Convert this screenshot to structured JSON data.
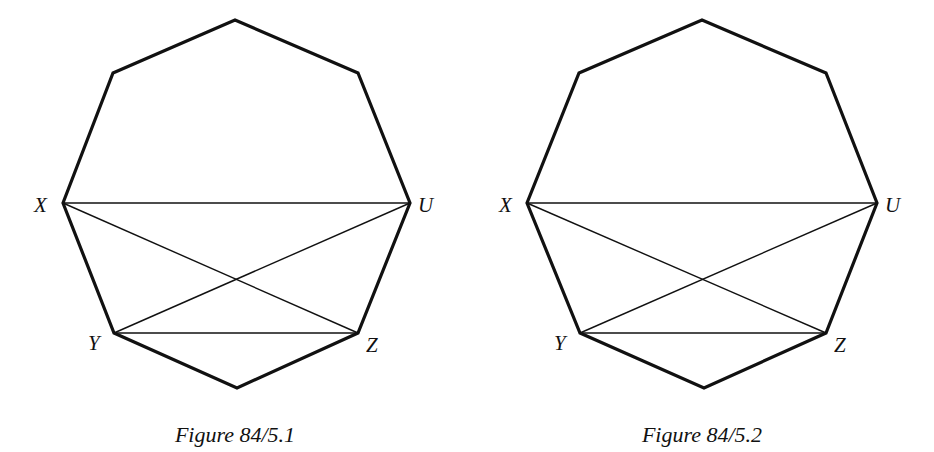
{
  "figures": [
    {
      "caption": "Figure 84/5.1",
      "labels": {
        "X": "X",
        "U": "U",
        "Y": "Y",
        "Z": "Z"
      },
      "shape": "octagon",
      "chords": [
        "XU",
        "XZ",
        "UY",
        "YZ"
      ]
    },
    {
      "caption": "Figure 84/5.2",
      "labels": {
        "X": "X",
        "U": "U",
        "Y": "Y",
        "Z": "Z"
      },
      "shape": "octagon",
      "chords": [
        "XU",
        "XZ",
        "UY",
        "YZ"
      ]
    }
  ]
}
